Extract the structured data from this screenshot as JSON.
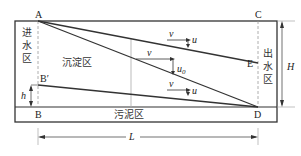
{
  "diagram": {
    "points": {
      "A": "A",
      "B": "B",
      "B_prime": "B′",
      "C": "C",
      "D": "D",
      "E": "E"
    },
    "zones": {
      "inlet": [
        "进",
        "水",
        "区"
      ],
      "settling": "沉淀区",
      "outlet": [
        "出",
        "水",
        "区"
      ],
      "sludge": "污泥区"
    },
    "dimensions": {
      "height_total": "H",
      "height_partial": "h",
      "length": "L"
    },
    "velocities": [
      {
        "horizontal": "v",
        "vertical": "u",
        "vertical_sub": ""
      },
      {
        "horizontal": "v",
        "vertical": "u",
        "vertical_sub": "0"
      },
      {
        "horizontal": "v",
        "vertical": "u",
        "vertical_sub": ""
      }
    ],
    "colors": {
      "stroke": "#333333",
      "dashed": "#999999",
      "guide": "#aaaaaa"
    }
  }
}
